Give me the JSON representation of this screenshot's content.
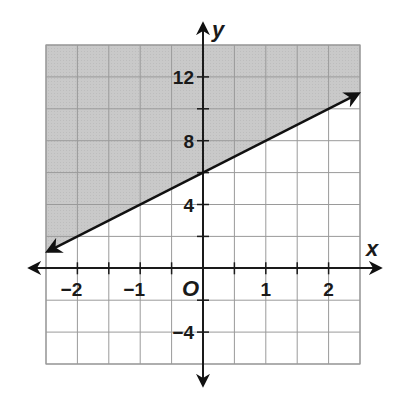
{
  "chart_data": {
    "type": "line",
    "subtype": "linear-inequality-graph",
    "title": "",
    "xlabel": "x",
    "ylabel": "y",
    "xlim": [
      -2.5,
      2.5
    ],
    "ylim": [
      -6,
      14
    ],
    "grid": true,
    "grid_step": {
      "x": 0.5,
      "y": 2
    },
    "x_ticks": [
      -2,
      -1,
      1,
      2
    ],
    "x_tick_labels": [
      "−2",
      "−1",
      "1",
      "2"
    ],
    "y_ticks": [
      12,
      8,
      4,
      -4
    ],
    "y_tick_labels": [
      "12",
      "8",
      "4",
      "−4"
    ],
    "origin_label": "O",
    "boundary_line": {
      "equation": "y = 2x + 6",
      "slope": 2,
      "intercept": 6,
      "style": "solid",
      "points": [
        [
          -2.5,
          1
        ],
        [
          0,
          6
        ],
        [
          2.5,
          11
        ]
      ],
      "arrows": "both"
    },
    "shaded_region": "above",
    "inequality": "y ≥ 2x + 6",
    "colors": {
      "shade": "#c8c8c8",
      "grid": "#9a9a9a",
      "axis": "#1a1a1a",
      "line": "#111111"
    }
  },
  "labels": {
    "x_axis": "x",
    "y_axis": "y",
    "origin": "O",
    "x_ticks": [
      "−2",
      "−1",
      "1",
      "2"
    ],
    "y_ticks": [
      "12",
      "8",
      "4",
      "−4"
    ]
  }
}
